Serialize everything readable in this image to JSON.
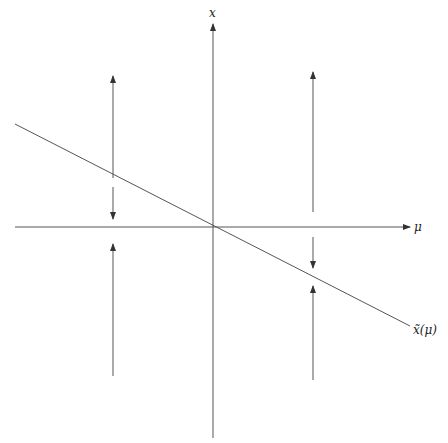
{
  "diagram": {
    "type": "phase-line / bifurcation diagram",
    "colors": {
      "stroke": "#555555",
      "label": "#222222",
      "background": "#ffffff"
    },
    "axes": {
      "vertical_label": "x",
      "horizontal_label": "μ"
    },
    "curve": {
      "label": "x̃(μ)",
      "description": "line of equilibria through origin with negative slope"
    },
    "flow_arrows": {
      "left_column": [
        "up (above curve, away)",
        "down (toward curve from below? toward axis)",
        "up (below axis)"
      ],
      "right_column": [
        "up (above axis)",
        "down (toward curve)",
        "up (toward curve)"
      ]
    }
  }
}
